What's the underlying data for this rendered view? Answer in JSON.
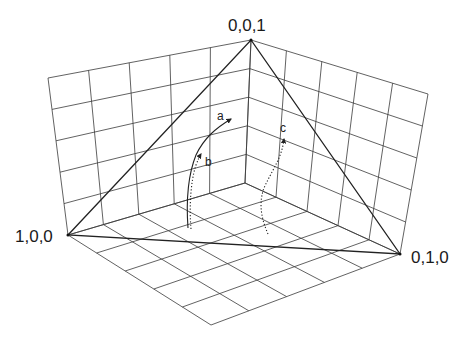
{
  "diagram": {
    "type": "3D simplex trajectory plot",
    "grid_divisions": 5,
    "points": {
      "origin": [
        245,
        183
      ],
      "top": [
        251,
        40
      ],
      "left": [
        68,
        235
      ],
      "right": [
        400,
        254
      ],
      "left_wall_top": [
        48,
        78
      ],
      "right_wall_top": [
        428,
        94
      ],
      "floor_front": [
        211,
        325
      ]
    },
    "vertices": [
      {
        "id": "z",
        "label": "0,0,1",
        "pos": [
          228,
          17
        ]
      },
      {
        "id": "x",
        "label": "1,0,0",
        "pos": [
          15,
          228
        ]
      },
      {
        "id": "y",
        "label": "0,1,0",
        "pos": [
          411,
          249
        ]
      }
    ],
    "curves": [
      {
        "id": "a",
        "label": "a",
        "style": "solid",
        "label_pos": [
          217,
          110
        ],
        "path": "M188,228 C186,200 188,175 196,155 C204,138 216,128 231,119"
      },
      {
        "id": "b",
        "label": "b",
        "style": "dotted",
        "label_pos": [
          205,
          156
        ],
        "path": "M191,229 C189,205 191,180 196,165 C198,160 199,157 201,154"
      },
      {
        "id": "c",
        "label": "c",
        "style": "dotted",
        "label_pos": [
          280,
          122
        ],
        "path": "M268,234 C262,220 258,205 264,188 C272,170 282,158 284,139"
      }
    ],
    "colors": {
      "grid": "#3a3a3a",
      "triangle": "#222222",
      "curve": "#222222"
    }
  }
}
